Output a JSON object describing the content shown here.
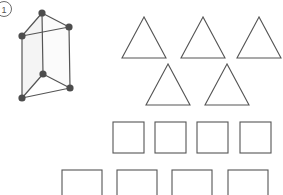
{
  "worksheet": {
    "item_number": "1",
    "stroke_color": "#555555",
    "vertex_color": "#4d4d4d",
    "face_shade": "#f4f4f4",
    "background": "#ffffff",
    "solid": {
      "name": "triangular-prism",
      "vertex_count": 6,
      "edge_count": 9,
      "vertices": [
        {
          "id": "top-back",
          "x": 42,
          "y": 13
        },
        {
          "id": "left-back",
          "x": 22,
          "y": 36
        },
        {
          "id": "right-back",
          "x": 69,
          "y": 27
        },
        {
          "id": "top-front",
          "x": 43,
          "y": 74
        },
        {
          "id": "left-front",
          "x": 22,
          "y": 98
        },
        {
          "id": "right-front",
          "x": 70,
          "y": 88
        }
      ],
      "edges": [
        [
          "top-back",
          "left-back"
        ],
        [
          "top-back",
          "right-back"
        ],
        [
          "left-back",
          "right-back"
        ],
        [
          "top-front",
          "left-front"
        ],
        [
          "top-front",
          "right-front"
        ],
        [
          "left-front",
          "right-front"
        ],
        [
          "top-back",
          "top-front"
        ],
        [
          "left-back",
          "left-front"
        ],
        [
          "right-back",
          "right-front"
        ]
      ]
    },
    "triangle_rows": [
      {
        "count": 3,
        "triangles": [
          {
            "left": 122,
            "top": 17,
            "width": 44,
            "height": 41
          },
          {
            "left": 181,
            "top": 17,
            "width": 44,
            "height": 41
          },
          {
            "left": 237,
            "top": 17,
            "width": 44,
            "height": 41
          }
        ]
      },
      {
        "count": 2,
        "triangles": [
          {
            "left": 146,
            "top": 64,
            "width": 44,
            "height": 41
          },
          {
            "left": 205,
            "top": 64,
            "width": 44,
            "height": 41
          }
        ]
      }
    ],
    "square_rows": [
      {
        "count": 4,
        "squares": [
          {
            "left": 113,
            "top": 122,
            "size": 31
          },
          {
            "left": 155,
            "top": 122,
            "size": 31
          },
          {
            "left": 197,
            "top": 122,
            "size": 31
          },
          {
            "left": 240,
            "top": 122,
            "size": 31
          }
        ]
      },
      {
        "count": 4,
        "clipped_at_bottom": true,
        "squares": [
          {
            "left": 62,
            "top": 170,
            "size": 40
          },
          {
            "left": 117,
            "top": 170,
            "size": 40
          },
          {
            "left": 172,
            "top": 170,
            "size": 40
          },
          {
            "left": 228,
            "top": 170,
            "size": 40
          }
        ]
      }
    ]
  }
}
